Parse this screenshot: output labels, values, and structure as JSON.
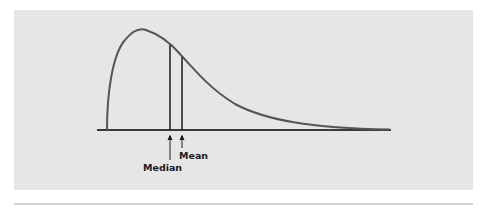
{
  "figure": {
    "type": "skewed-distribution-diagram",
    "labels": {
      "median": "Median",
      "mean": "Mean"
    },
    "colors": {
      "panel": "#e6e6e6",
      "curve": "#555555",
      "lines": "#1a1a1a",
      "divider": "#d2d2d2"
    }
  }
}
